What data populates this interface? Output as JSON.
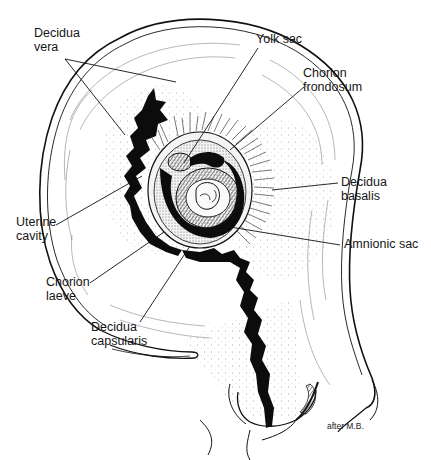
{
  "figure": {
    "header_fragment": "",
    "credit": "after M.B.",
    "colors": {
      "ink": "#111111",
      "background": "#ffffff",
      "stipple": "#555555"
    }
  },
  "labels": {
    "decidua_vera": [
      "Decidua",
      "vera"
    ],
    "yolk_sac": "Yolk sac",
    "chorion_frondosum": [
      "Chorion",
      "frondosum"
    ],
    "decidua_basalis": [
      "Decidua",
      "basalis"
    ],
    "amnionic_sac": "Amnionic sac",
    "uterine_cavity": [
      "Uterine",
      "cavity"
    ],
    "chorion_laeve": [
      "Chorion",
      "laeve"
    ],
    "decidua_capsularis": [
      "Decidua",
      "capsularis"
    ]
  }
}
